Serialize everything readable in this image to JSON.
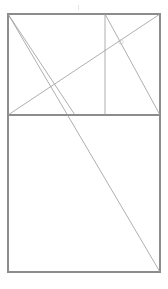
{
  "figure": {
    "canvas": {
      "width": 168,
      "height": 289,
      "background": "#ffffff"
    },
    "colors": {
      "frame_stroke": "#8c8c8c",
      "divider_stroke": "#8c8c8c",
      "diagonal_stroke": "#9a9a9a",
      "faint_stroke": "#c8c8c8",
      "marker": "#b0b0b0"
    },
    "stroke_widths": {
      "frame": 1.1,
      "divider": 1.1,
      "diagonal": 0.8,
      "faint": 0.6
    },
    "bounds": {
      "left": 8,
      "top": 14,
      "right": 160,
      "bottom": 272
    },
    "guides": {
      "horizontal_divider_y": 115,
      "vertical_line_x": 105
    },
    "shapes": [
      {
        "name": "outer-rectangle",
        "kind": "rect",
        "x": 8,
        "y": 14,
        "width": 152,
        "height": 258,
        "stroke": "#8c8c8c",
        "stroke_width": 1.1,
        "fill": "none"
      }
    ],
    "lines": [
      {
        "name": "horizontal-divider",
        "label": "Horizontal divider",
        "x1": 8,
        "y1": 115,
        "x2": 160,
        "y2": 115,
        "stroke": "#8c8c8c",
        "stroke_width": 1.1
      },
      {
        "name": "vertical-guide",
        "label": "Vertical guide in upper rectangle",
        "x1": 105,
        "y1": 14,
        "x2": 105,
        "y2": 115,
        "stroke": "#9a9a9a",
        "stroke_width": 0.8
      },
      {
        "name": "rising-diagonal",
        "label": "Rising diagonal, lower-left to upper-right of upper rectangle",
        "x1": 8,
        "y1": 115,
        "x2": 160,
        "y2": 14,
        "stroke": "#9a9a9a",
        "stroke_width": 0.8
      },
      {
        "name": "short-falling-diagonal",
        "label": "Falling diagonal from top of vertical guide to lower-right corner of upper rectangle",
        "x1": 105,
        "y1": 14,
        "x2": 160,
        "y2": 115,
        "stroke": "#9a9a9a",
        "stroke_width": 0.8
      },
      {
        "name": "upper-falling-diagonal",
        "label": "Falling diagonal from top-left corner across upper rectangle",
        "x1": 8,
        "y1": 14,
        "x2": 75,
        "y2": 115,
        "stroke": "#9a9a9a",
        "stroke_width": 0.8
      },
      {
        "name": "long-falling-diagonal",
        "label": "Long diagonal from top-left corner to bottom-right corner of the figure",
        "x1": 8,
        "y1": 14,
        "x2": 160,
        "y2": 272,
        "stroke": "#9a9a9a",
        "stroke_width": 0.8
      }
    ],
    "markers": [
      {
        "name": "intersection-marker",
        "label": "Intersection point marker in upper right area",
        "cx": 121,
        "cy": 42,
        "r": 2.2,
        "stroke": "#b4b4b4",
        "text": ""
      },
      {
        "name": "top-edge-tick",
        "label": "Faint tick above top edge",
        "x1": 78,
        "y1": 5,
        "x2": 78,
        "y2": 10,
        "stroke": "#d2d2d2"
      }
    ]
  }
}
